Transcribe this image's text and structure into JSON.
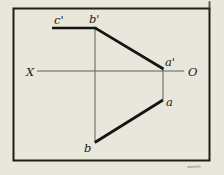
{
  "canvas": {
    "width": 224,
    "height": 175,
    "paper_color": "#e9e6dc",
    "frame_color": "#1e1d1b",
    "frame_line_width": 2,
    "thick_line_color": "#141414",
    "thick_line_width": 2.7,
    "thin_line_color": "#5f5f5f",
    "thin_line_width": 1,
    "label_color": "#1a1a1a"
  },
  "frame": {
    "x": 13.5,
    "y": 8.5,
    "width": 196,
    "height": 152
  },
  "diagram": {
    "segments": [
      {
        "name": "axis-line-x-o",
        "x1": 37,
        "y1": 71,
        "x2": 184,
        "y2": 71,
        "kind": "thin"
      },
      {
        "name": "projection-line-bprime-b",
        "x1": 95,
        "y1": 28,
        "x2": 95,
        "y2": 142,
        "kind": "thin"
      },
      {
        "name": "projection-line-aprime-a",
        "x1": 163,
        "y1": 69,
        "x2": 163,
        "y2": 100,
        "kind": "thin"
      },
      {
        "name": "edge-cprime-bprime",
        "x1": 52,
        "y1": 28,
        "x2": 96.5,
        "y2": 28,
        "kind": "thick"
      },
      {
        "name": "edge-bprime-aprime",
        "x1": 95,
        "y1": 27.8,
        "x2": 163.5,
        "y2": 69,
        "kind": "thick"
      },
      {
        "name": "edge-a-b",
        "x1": 163,
        "y1": 100,
        "x2": 94.8,
        "y2": 142.5,
        "kind": "thick"
      }
    ],
    "labels": [
      {
        "name": "label-c-prime",
        "text": "c'",
        "x": 54,
        "y": 24
      },
      {
        "name": "label-b-prime",
        "text": "b'",
        "x": 89,
        "y": 23
      },
      {
        "name": "label-x-axis-end",
        "text": "X",
        "x": 26,
        "y": 76
      },
      {
        "name": "label-a-prime",
        "text": "a'",
        "x": 165,
        "y": 66
      },
      {
        "name": "label-o-axis-end",
        "text": "O",
        "x": 188,
        "y": 76
      },
      {
        "name": "label-a",
        "text": "a",
        "x": 166,
        "y": 106
      },
      {
        "name": "label-b",
        "text": "b",
        "x": 84,
        "y": 152
      }
    ]
  },
  "artifacts": [
    {
      "name": "scan-nick-top-right",
      "x1": 209.5,
      "y1": 2,
      "x2": 209.5,
      "y2": 9,
      "color": "#3a3834",
      "width": 2,
      "opacity": 0.8
    },
    {
      "name": "scan-smudge-bottom-right",
      "x1": 188,
      "y1": 167,
      "x2": 200,
      "y2": 166.5,
      "color": "#a8a294",
      "width": 2,
      "opacity": 0.7
    }
  ]
}
